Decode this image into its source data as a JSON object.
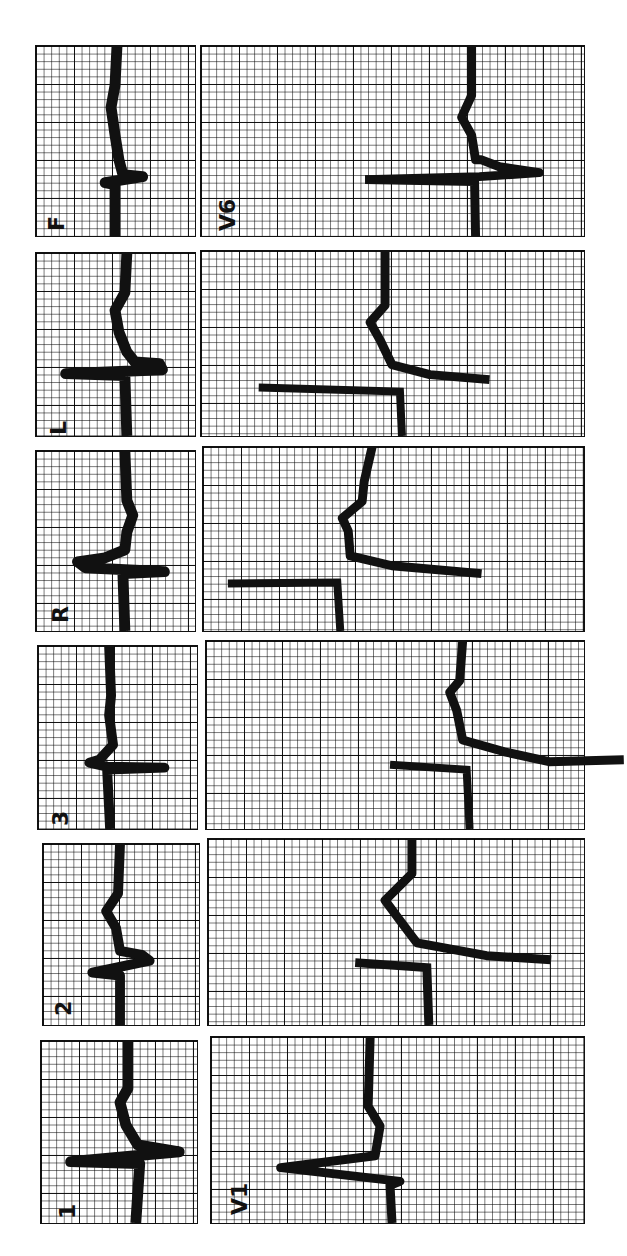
{
  "document": {
    "description": "Rotated 12-lead ECG tracing printed on grid paper",
    "orientation": "rotated 90 degrees counter-clockwise"
  },
  "limb_leads": [
    {
      "label": "F"
    },
    {
      "label": "L"
    },
    {
      "label": "R"
    },
    {
      "label": "3"
    },
    {
      "label": "2"
    },
    {
      "label": "1"
    }
  ],
  "chest_leads": [
    {
      "label": "V6"
    },
    {
      "label": ""
    },
    {
      "label": ""
    },
    {
      "label": ""
    },
    {
      "label": ""
    },
    {
      "label": "V1"
    }
  ],
  "colors": {
    "ink": "#111111",
    "paper": "#ffffff",
    "grid": "#000000"
  }
}
